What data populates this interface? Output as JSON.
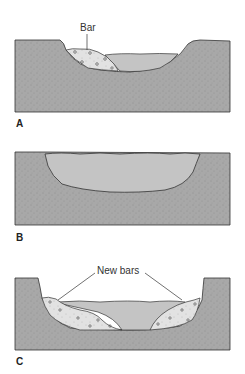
{
  "diagram": {
    "type": "river channel cross-sections",
    "colors": {
      "ground": "#a8a8a8",
      "water": "#c4c4c4",
      "bar": "#e2e2e2",
      "outline": "#333333",
      "background": "#ffffff"
    },
    "panels": [
      {
        "id": "A",
        "label": "A",
        "callouts": [
          "Bar"
        ]
      },
      {
        "id": "B",
        "label": "B",
        "callouts": []
      },
      {
        "id": "C",
        "label": "C",
        "callouts": [
          "New bars"
        ]
      }
    ]
  }
}
